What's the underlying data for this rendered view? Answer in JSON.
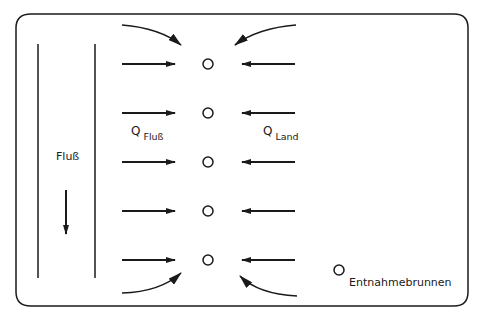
{
  "diagram": {
    "river_label": "Fluß",
    "q_river": {
      "symbol": "Q",
      "subscript": "Fluß"
    },
    "q_land": {
      "symbol": "Q",
      "subscript": "Land"
    },
    "legend": {
      "symbol": "well-circle",
      "label": "Entnahmebrunnen"
    },
    "wells_count": 5,
    "colors": {
      "stroke": "#1a1a1a",
      "background": "#ffffff"
    }
  }
}
